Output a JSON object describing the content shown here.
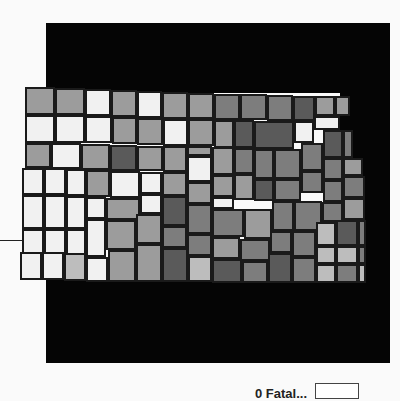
{
  "map": {
    "title": "Kansas counties choropleth",
    "shades": {
      "0": "#f1f1f1",
      "1": "#bdbdbd",
      "2": "#9c9c9c",
      "3": "#7d7d7d",
      "4": "#5a5a5a",
      "5": "#464646"
    },
    "background_color": "#050505",
    "counties": [
      {
        "x": 25,
        "y": 87,
        "w": 30,
        "h": 28,
        "s": 2
      },
      {
        "x": 55,
        "y": 88,
        "w": 30,
        "h": 27,
        "s": 2
      },
      {
        "x": 85,
        "y": 89,
        "w": 26,
        "h": 27,
        "s": 0
      },
      {
        "x": 111,
        "y": 90,
        "w": 26,
        "h": 27,
        "s": 2
      },
      {
        "x": 137,
        "y": 91,
        "w": 25,
        "h": 27,
        "s": 0
      },
      {
        "x": 162,
        "y": 92,
        "w": 26,
        "h": 27,
        "s": 2
      },
      {
        "x": 188,
        "y": 93,
        "w": 26,
        "h": 26,
        "s": 2
      },
      {
        "x": 214,
        "y": 94,
        "w": 26,
        "h": 26,
        "s": 3
      },
      {
        "x": 240,
        "y": 94,
        "w": 27,
        "h": 26,
        "s": 3
      },
      {
        "x": 267,
        "y": 95,
        "w": 26,
        "h": 26,
        "s": 3
      },
      {
        "x": 293,
        "y": 96,
        "w": 22,
        "h": 25,
        "s": 4
      },
      {
        "x": 315,
        "y": 96,
        "w": 20,
        "h": 20,
        "s": 2
      },
      {
        "x": 335,
        "y": 96,
        "w": 15,
        "h": 20,
        "s": 2
      },
      {
        "x": 25,
        "y": 115,
        "w": 30,
        "h": 28,
        "s": 0
      },
      {
        "x": 55,
        "y": 115,
        "w": 30,
        "h": 28,
        "s": 0
      },
      {
        "x": 85,
        "y": 116,
        "w": 27,
        "h": 27,
        "s": 0
      },
      {
        "x": 112,
        "y": 117,
        "w": 25,
        "h": 27,
        "s": 2
      },
      {
        "x": 137,
        "y": 118,
        "w": 26,
        "h": 27,
        "s": 2
      },
      {
        "x": 163,
        "y": 119,
        "w": 25,
        "h": 27,
        "s": 0
      },
      {
        "x": 188,
        "y": 119,
        "w": 26,
        "h": 27,
        "s": 2
      },
      {
        "x": 214,
        "y": 120,
        "w": 20,
        "h": 28,
        "s": 2
      },
      {
        "x": 234,
        "y": 120,
        "w": 20,
        "h": 28,
        "s": 4
      },
      {
        "x": 254,
        "y": 121,
        "w": 40,
        "h": 28,
        "s": 4
      },
      {
        "x": 294,
        "y": 121,
        "w": 20,
        "h": 22,
        "s": 0
      },
      {
        "x": 314,
        "y": 116,
        "w": 26,
        "h": 14,
        "s": 0
      },
      {
        "x": 323,
        "y": 130,
        "w": 20,
        "h": 28,
        "s": 4
      },
      {
        "x": 343,
        "y": 130,
        "w": 10,
        "h": 28,
        "s": 3
      },
      {
        "x": 25,
        "y": 143,
        "w": 26,
        "h": 25,
        "s": 2
      },
      {
        "x": 51,
        "y": 143,
        "w": 30,
        "h": 26,
        "s": 0
      },
      {
        "x": 81,
        "y": 144,
        "w": 29,
        "h": 26,
        "s": 2
      },
      {
        "x": 110,
        "y": 145,
        "w": 27,
        "h": 26,
        "s": 4
      },
      {
        "x": 137,
        "y": 146,
        "w": 26,
        "h": 25,
        "s": 2
      },
      {
        "x": 163,
        "y": 146,
        "w": 24,
        "h": 26,
        "s": 2
      },
      {
        "x": 187,
        "y": 146,
        "w": 25,
        "h": 10,
        "s": 2
      },
      {
        "x": 187,
        "y": 156,
        "w": 25,
        "h": 26,
        "s": 0
      },
      {
        "x": 212,
        "y": 147,
        "w": 22,
        "h": 28,
        "s": 2
      },
      {
        "x": 234,
        "y": 148,
        "w": 20,
        "h": 26,
        "s": 3
      },
      {
        "x": 254,
        "y": 149,
        "w": 20,
        "h": 30,
        "s": 3
      },
      {
        "x": 274,
        "y": 149,
        "w": 27,
        "h": 30,
        "s": 3
      },
      {
        "x": 301,
        "y": 143,
        "w": 22,
        "h": 28,
        "s": 3
      },
      {
        "x": 323,
        "y": 158,
        "w": 20,
        "h": 22,
        "s": 3
      },
      {
        "x": 343,
        "y": 158,
        "w": 20,
        "h": 18,
        "s": 2
      },
      {
        "x": 22,
        "y": 168,
        "w": 22,
        "h": 27,
        "s": 0
      },
      {
        "x": 44,
        "y": 168,
        "w": 22,
        "h": 27,
        "s": 0
      },
      {
        "x": 66,
        "y": 169,
        "w": 20,
        "h": 27,
        "s": 0
      },
      {
        "x": 86,
        "y": 170,
        "w": 24,
        "h": 27,
        "s": 2
      },
      {
        "x": 110,
        "y": 171,
        "w": 30,
        "h": 27,
        "s": 0
      },
      {
        "x": 140,
        "y": 172,
        "w": 22,
        "h": 22,
        "s": 0
      },
      {
        "x": 162,
        "y": 172,
        "w": 25,
        "h": 24,
        "s": 2
      },
      {
        "x": 187,
        "y": 182,
        "w": 25,
        "h": 22,
        "s": 2
      },
      {
        "x": 212,
        "y": 175,
        "w": 22,
        "h": 22,
        "s": 2
      },
      {
        "x": 234,
        "y": 174,
        "w": 20,
        "h": 26,
        "s": 2
      },
      {
        "x": 254,
        "y": 179,
        "w": 20,
        "h": 22,
        "s": 4
      },
      {
        "x": 274,
        "y": 179,
        "w": 27,
        "h": 22,
        "s": 3
      },
      {
        "x": 301,
        "y": 171,
        "w": 22,
        "h": 22,
        "s": 3
      },
      {
        "x": 323,
        "y": 180,
        "w": 20,
        "h": 22,
        "s": 3
      },
      {
        "x": 343,
        "y": 176,
        "w": 22,
        "h": 22,
        "s": 3
      },
      {
        "x": 22,
        "y": 195,
        "w": 22,
        "h": 34,
        "s": 0
      },
      {
        "x": 44,
        "y": 195,
        "w": 22,
        "h": 34,
        "s": 0
      },
      {
        "x": 66,
        "y": 196,
        "w": 20,
        "h": 33,
        "s": 0
      },
      {
        "x": 86,
        "y": 197,
        "w": 20,
        "h": 22,
        "s": 0
      },
      {
        "x": 106,
        "y": 198,
        "w": 34,
        "h": 22,
        "s": 2
      },
      {
        "x": 140,
        "y": 194,
        "w": 22,
        "h": 20,
        "s": 0
      },
      {
        "x": 162,
        "y": 196,
        "w": 25,
        "h": 30,
        "s": 4
      },
      {
        "x": 187,
        "y": 204,
        "w": 25,
        "h": 30,
        "s": 3
      },
      {
        "x": 212,
        "y": 197,
        "w": 22,
        "h": 12,
        "s": 0
      },
      {
        "x": 212,
        "y": 209,
        "w": 32,
        "h": 28,
        "s": 3
      },
      {
        "x": 244,
        "y": 209,
        "w": 28,
        "h": 30,
        "s": 2
      },
      {
        "x": 272,
        "y": 201,
        "w": 22,
        "h": 30,
        "s": 3
      },
      {
        "x": 294,
        "y": 201,
        "w": 28,
        "h": 30,
        "s": 3
      },
      {
        "x": 322,
        "y": 202,
        "w": 21,
        "h": 20,
        "s": 3
      },
      {
        "x": 343,
        "y": 198,
        "w": 22,
        "h": 22,
        "s": 2
      },
      {
        "x": 86,
        "y": 219,
        "w": 20,
        "h": 38,
        "s": 0
      },
      {
        "x": 106,
        "y": 220,
        "w": 30,
        "h": 30,
        "s": 2
      },
      {
        "x": 136,
        "y": 214,
        "w": 26,
        "h": 30,
        "s": 2
      },
      {
        "x": 162,
        "y": 226,
        "w": 25,
        "h": 22,
        "s": 3
      },
      {
        "x": 187,
        "y": 234,
        "w": 25,
        "h": 22,
        "s": 3
      },
      {
        "x": 212,
        "y": 237,
        "w": 28,
        "h": 22,
        "s": 2
      },
      {
        "x": 240,
        "y": 239,
        "w": 30,
        "h": 22,
        "s": 3
      },
      {
        "x": 270,
        "y": 231,
        "w": 22,
        "h": 22,
        "s": 3
      },
      {
        "x": 292,
        "y": 231,
        "w": 24,
        "h": 26,
        "s": 3
      },
      {
        "x": 316,
        "y": 222,
        "w": 20,
        "h": 24,
        "s": 1
      },
      {
        "x": 336,
        "y": 220,
        "w": 22,
        "h": 26,
        "s": 4
      },
      {
        "x": 358,
        "y": 220,
        "w": 8,
        "h": 26,
        "s": 3
      },
      {
        "x": 22,
        "y": 229,
        "w": 22,
        "h": 28,
        "s": 0
      },
      {
        "x": 44,
        "y": 229,
        "w": 22,
        "h": 28,
        "s": 0
      },
      {
        "x": 66,
        "y": 229,
        "w": 20,
        "h": 28,
        "s": 0
      },
      {
        "x": 316,
        "y": 246,
        "w": 20,
        "h": 18,
        "s": 1
      },
      {
        "x": 336,
        "y": 246,
        "w": 22,
        "h": 18,
        "s": 1
      },
      {
        "x": 358,
        "y": 246,
        "w": 8,
        "h": 18,
        "s": 3
      },
      {
        "x": 20,
        "y": 252,
        "w": 22,
        "h": 28,
        "s": 0
      },
      {
        "x": 42,
        "y": 252,
        "w": 22,
        "h": 28,
        "s": 0
      },
      {
        "x": 64,
        "y": 253,
        "w": 22,
        "h": 28,
        "s": 1
      },
      {
        "x": 86,
        "y": 257,
        "w": 22,
        "h": 25,
        "s": 0
      },
      {
        "x": 108,
        "y": 250,
        "w": 28,
        "h": 32,
        "s": 2
      },
      {
        "x": 136,
        "y": 244,
        "w": 26,
        "h": 38,
        "s": 2
      },
      {
        "x": 162,
        "y": 248,
        "w": 26,
        "h": 34,
        "s": 4
      },
      {
        "x": 188,
        "y": 256,
        "w": 24,
        "h": 26,
        "s": 1
      },
      {
        "x": 212,
        "y": 259,
        "w": 30,
        "h": 24,
        "s": 4
      },
      {
        "x": 242,
        "y": 261,
        "w": 26,
        "h": 22,
        "s": 3
      },
      {
        "x": 268,
        "y": 253,
        "w": 24,
        "h": 30,
        "s": 4
      },
      {
        "x": 292,
        "y": 257,
        "w": 24,
        "h": 26,
        "s": 3
      },
      {
        "x": 316,
        "y": 264,
        "w": 20,
        "h": 19,
        "s": 1
      },
      {
        "x": 336,
        "y": 264,
        "w": 22,
        "h": 19,
        "s": 3
      },
      {
        "x": 358,
        "y": 264,
        "w": 8,
        "h": 19,
        "s": 1
      }
    ]
  },
  "legend": {
    "label": "0 Fatal...",
    "swatch_color": "#ffffff"
  }
}
